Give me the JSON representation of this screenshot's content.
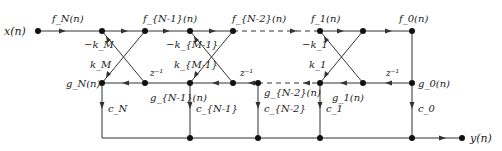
{
  "diagram": {
    "type": "lattice-ladder filter structure",
    "input_label": "x(n)",
    "output_label": "y(n)",
    "forward_labels": {
      "fN": "f_N(n)",
      "fN1": "f_{N-1}(n)",
      "fN2": "f_{N-2}(n)",
      "f1": "f_1(n)",
      "f0": "f_0(n)"
    },
    "backward_labels": {
      "gN": "g_N(n)",
      "gN1": "g_{N-1}(n)",
      "gN2": "g_{N-2}(n)",
      "g1": "g_1(n)",
      "g0": "g_0(n)"
    },
    "reflection_coeffs": {
      "negkM": "−k_M",
      "kM": "k_M",
      "negkM1": "−k_{M-1}",
      "kM1": "k_{M-1}",
      "negk1": "−k_1",
      "k1": "k_1"
    },
    "delay_label": "z⁻¹",
    "ladder_coeffs": {
      "cN": "c_N",
      "cN1": "c_{N-1}",
      "cN2": "c_{N-2}",
      "c1": "c_1",
      "c0": "c_0"
    }
  }
}
